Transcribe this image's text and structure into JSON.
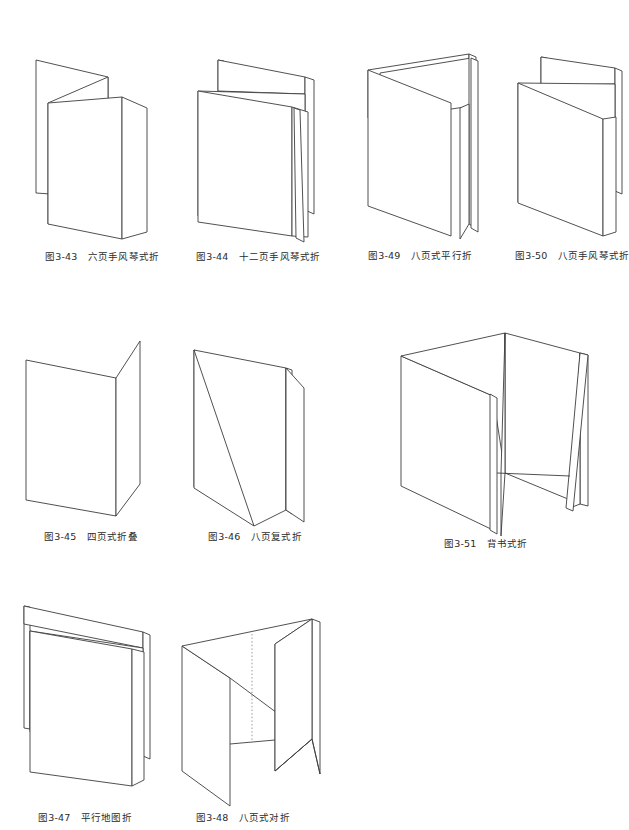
{
  "document": {
    "type": "illustration-plate",
    "subject": "纸张折叠方式示意图",
    "page_width": 628,
    "page_height": 830,
    "background_color": "#ffffff",
    "line_color": "#3d3d3d",
    "dotted_line_color": "#8a8a8a"
  },
  "figures": [
    {
      "id": "fig-3-43",
      "number": "图3-43",
      "title": "六页手风琴式折",
      "caption": "图3-43　六页手风琴式折",
      "row": 1,
      "column": 1,
      "panels": 3,
      "fold_type": "accordion"
    },
    {
      "id": "fig-3-44",
      "number": "图3-44",
      "title": "十二页手风琴式折",
      "caption": "图3-44　十二页手风琴式折",
      "row": 1,
      "column": 2,
      "panels": 6,
      "fold_type": "accordion"
    },
    {
      "id": "fig-3-49",
      "number": "图3-49",
      "title": "八页式平行折",
      "caption": "图3-49　八页式平行折",
      "row": 1,
      "column": 3,
      "panels": 4,
      "fold_type": "parallel"
    },
    {
      "id": "fig-3-50",
      "number": "图3-50",
      "title": "八页手风琴式折",
      "caption": "图3-50　八页手风琴式折",
      "row": 1,
      "column": 4,
      "panels": 4,
      "fold_type": "accordion"
    },
    {
      "id": "fig-3-45",
      "number": "图3-45",
      "title": "四页式折叠",
      "caption": "图3-45　四页式折叠",
      "row": 2,
      "column": 1,
      "panels": 2,
      "fold_type": "single-fold"
    },
    {
      "id": "fig-3-46",
      "number": "图3-46",
      "title": "八页复式折",
      "caption": "图3-46　八页复式折",
      "row": 2,
      "column": 2,
      "panels": 4,
      "fold_type": "compound"
    },
    {
      "id": "fig-3-51",
      "number": "图3-51",
      "title": "背书式折",
      "caption": "图3-51　背书式折",
      "row": 2,
      "column": 3,
      "panels": 4,
      "fold_type": "back-fold"
    },
    {
      "id": "fig-3-47",
      "number": "图3-47",
      "title": "平行地图折",
      "caption": "图3-47　平行地图折",
      "row": 3,
      "column": 1,
      "panels": 4,
      "fold_type": "parallel-map"
    },
    {
      "id": "fig-3-48",
      "number": "图3-48",
      "title": "八页式对折",
      "caption": "图3-48　八页式对折",
      "row": 3,
      "column": 2,
      "panels": 4,
      "fold_type": "gate-fold",
      "has_dotted_center_line": true
    }
  ]
}
